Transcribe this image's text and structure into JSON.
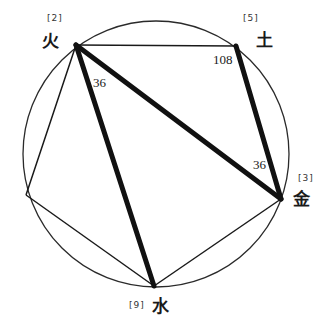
{
  "diagram": {
    "circle": {
      "cx": 156,
      "cy": 154,
      "r": 133
    },
    "vertices": [
      {
        "id": "fire",
        "label": "火",
        "tag": "[2]",
        "x": 76,
        "y": 45
      },
      {
        "id": "earth",
        "label": "土",
        "tag": "[5]",
        "x": 236,
        "y": 46
      },
      {
        "id": "metal",
        "label": "金",
        "tag": "[3]",
        "x": 281,
        "y": 199
      },
      {
        "id": "water",
        "label": "水",
        "tag": "[9]",
        "x": 154,
        "y": 286
      },
      {
        "id": "left",
        "label": "",
        "tag": "",
        "x": 26,
        "y": 195
      }
    ],
    "thin_edges": [
      [
        "fire",
        "earth"
      ],
      [
        "metal",
        "water"
      ],
      [
        "water",
        "left"
      ],
      [
        "left",
        "fire"
      ]
    ],
    "thick_edges": [
      [
        "fire",
        "metal"
      ],
      [
        "fire",
        "water"
      ],
      [
        "earth",
        "metal"
      ]
    ],
    "angles": [
      {
        "value": "36",
        "at": "fire"
      },
      {
        "value": "108",
        "at": "earth"
      },
      {
        "value": "36",
        "at": "metal"
      }
    ],
    "colors": {
      "line": "#1a1a1a",
      "background": "#ffffff"
    }
  }
}
